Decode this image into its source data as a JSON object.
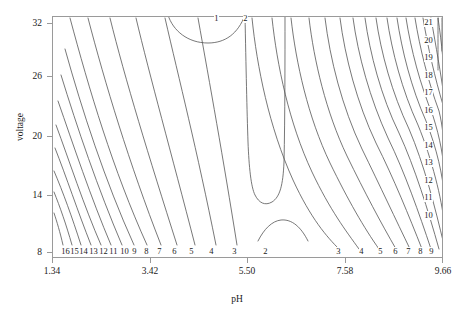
{
  "chart_data": {
    "type": "contour",
    "title": "",
    "xlabel": "pH",
    "ylabel": "voltage",
    "xlim": [
      1.34,
      9.66
    ],
    "ylim": [
      8,
      32
    ],
    "xticks": [
      "1.34",
      "3.42",
      "5.50",
      "7.58",
      "9.66"
    ],
    "xtick_values": [
      1.34,
      3.42,
      5.5,
      7.58,
      9.66
    ],
    "yticks": [
      "32",
      "26",
      "20",
      "14",
      "8"
    ],
    "ytick_values": [
      32,
      26,
      20,
      14,
      8
    ],
    "grid": false,
    "legend": "none",
    "line_color": "#555555",
    "frame_color": "#9a9a9a",
    "background": "#ffffff",
    "contour_levels": [
      1,
      2,
      3,
      4,
      5,
      6,
      7,
      8,
      9,
      10,
      11,
      12,
      13,
      14,
      15,
      16,
      17,
      18,
      19,
      20,
      21
    ],
    "bottom_left_labels": [
      "16",
      "15",
      "14",
      "13",
      "12",
      "11",
      "10",
      "9",
      "8",
      "7",
      "6",
      "5",
      "4",
      "3"
    ],
    "bottom_center_labels": [
      "2"
    ],
    "bottom_right_labels": [
      "3",
      "4",
      "5",
      "6",
      "7",
      "8",
      "9"
    ],
    "right_edge_labels": [
      "21",
      "20",
      "19",
      "18",
      "17",
      "16",
      "15",
      "14",
      "13",
      "12",
      "11",
      "10"
    ],
    "top_labels": [
      "1",
      "2"
    ]
  },
  "labels": {
    "x_axis": "pH",
    "y_axis": "voltage"
  },
  "xticks": [
    {
      "text": "1.34",
      "x": 52
    },
    {
      "text": "3.42",
      "x": 150
    },
    {
      "text": "5.50",
      "x": 247
    },
    {
      "text": "7.58",
      "x": 345
    },
    {
      "text": "9.66",
      "x": 443
    }
  ],
  "yticks": [
    {
      "text": "32",
      "y": 23
    },
    {
      "text": "26",
      "y": 76
    },
    {
      "text": "20",
      "y": 136
    },
    {
      "text": "14",
      "y": 195
    },
    {
      "text": "8",
      "y": 252
    }
  ],
  "contour_labels": [
    {
      "text": "1",
      "x": 214,
      "y": 14
    },
    {
      "text": "2",
      "x": 243,
      "y": 14
    },
    {
      "text": "21",
      "x": 424,
      "y": 18
    },
    {
      "text": "20",
      "x": 424,
      "y": 36
    },
    {
      "text": "19",
      "x": 424,
      "y": 53
    },
    {
      "text": "18",
      "x": 424,
      "y": 71
    },
    {
      "text": "17",
      "x": 424,
      "y": 88
    },
    {
      "text": "16",
      "x": 424,
      "y": 106
    },
    {
      "text": "15",
      "x": 424,
      "y": 123
    },
    {
      "text": "14",
      "x": 424,
      "y": 141
    },
    {
      "text": "13",
      "x": 424,
      "y": 158
    },
    {
      "text": "12",
      "x": 424,
      "y": 176
    },
    {
      "text": "11",
      "x": 424,
      "y": 193
    },
    {
      "text": "10",
      "x": 424,
      "y": 211
    },
    {
      "text": "16",
      "x": 61,
      "y": 247
    },
    {
      "text": "15",
      "x": 70,
      "y": 247
    },
    {
      "text": "14",
      "x": 79,
      "y": 247
    },
    {
      "text": "13",
      "x": 89,
      "y": 247
    },
    {
      "text": "12",
      "x": 99,
      "y": 247
    },
    {
      "text": "11",
      "x": 109,
      "y": 247
    },
    {
      "text": "10",
      "x": 120,
      "y": 247
    },
    {
      "text": "9",
      "x": 132,
      "y": 247
    },
    {
      "text": "8",
      "x": 144,
      "y": 247
    },
    {
      "text": "7",
      "x": 157,
      "y": 247
    },
    {
      "text": "6",
      "x": 172,
      "y": 247
    },
    {
      "text": "5",
      "x": 189,
      "y": 247
    },
    {
      "text": "4",
      "x": 209,
      "y": 247
    },
    {
      "text": "3",
      "x": 232,
      "y": 247
    },
    {
      "text": "2",
      "x": 263,
      "y": 247
    },
    {
      "text": "3",
      "x": 336,
      "y": 247
    },
    {
      "text": "4",
      "x": 359,
      "y": 247
    },
    {
      "text": "5",
      "x": 378,
      "y": 247
    },
    {
      "text": "6",
      "x": 393,
      "y": 247
    },
    {
      "text": "7",
      "x": 406,
      "y": 247
    },
    {
      "text": "8",
      "x": 418,
      "y": 247
    },
    {
      "text": "9",
      "x": 429,
      "y": 247
    }
  ]
}
